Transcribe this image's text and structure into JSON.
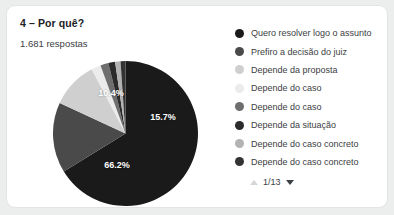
{
  "card": {
    "title": "4 – Por quê?",
    "response_count": "1.681 respostas"
  },
  "legend": {
    "items": [
      {
        "label": "Quero resolver logo o assunto",
        "color": "#1a1a1a"
      },
      {
        "label": "Prefiro a decisão do juiz",
        "color": "#4a4a4a"
      },
      {
        "label": "Depende da proposta",
        "color": "#cfcfcf"
      },
      {
        "label": "Depende do caso",
        "color": "#ebebeb"
      },
      {
        "label": "Depende do caso",
        "color": "#6e6e6e"
      },
      {
        "label": "Depende da situação",
        "color": "#2b2b2b"
      },
      {
        "label": "Depende do caso concreto",
        "color": "#b3b3b3"
      },
      {
        "label": "Depende do caso concreto",
        "color": "#333333"
      }
    ]
  },
  "pager": {
    "label": "1/13",
    "up_icon": "triangle-up-icon",
    "down_icon": "triangle-down-icon"
  },
  "chart_data": {
    "type": "pie",
    "title": "4 – Por quê?",
    "subtitle": "1.681 respostas",
    "total_responses": 1681,
    "legend_position": "right",
    "grid": false,
    "labels": [
      "Quero resolver logo o assunto",
      "Prefiro a decisão do juiz",
      "Depende da proposta",
      "Depende do caso",
      "Depende do caso",
      "Depende da situação",
      "Depende do caso concreto",
      "Depende do caso concreto"
    ],
    "values": [
      66.2,
      15.7,
      10.4,
      2.1,
      1.8,
      1.5,
      1.2,
      1.1
    ],
    "value_labels": [
      "66.2%",
      "15.7%",
      "10.4%",
      "",
      "",
      "",
      "",
      ""
    ],
    "displayed_labels": [
      "10.4%",
      "15.7%",
      "66.2%"
    ],
    "colors": [
      "#1a1a1a",
      "#4a4a4a",
      "#cfcfcf",
      "#ebebeb",
      "#6e6e6e",
      "#2b2b2b",
      "#b3b3b3",
      "#333333"
    ]
  }
}
